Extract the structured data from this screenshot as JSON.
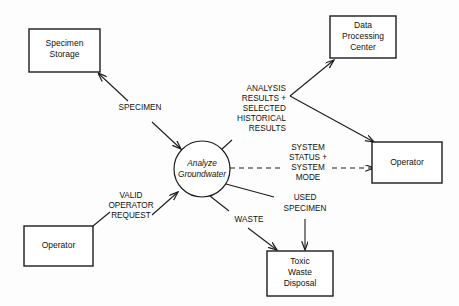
{
  "diagram": {
    "type": "data-flow-diagram",
    "background_color": "#fdfdfd",
    "line_color": "#1c1c1c",
    "process": {
      "name": "analyze-groundwater",
      "label_line1": "Analyze",
      "label_line2": "Groundwater",
      "shape": "circle",
      "cx": 202,
      "cy": 169,
      "r": 28
    },
    "entities": [
      {
        "name": "specimen-storage",
        "label_line1": "Specimen",
        "label_line2": "Storage",
        "label_line3": "",
        "x": 29,
        "y": 29,
        "w": 71,
        "h": 43
      },
      {
        "name": "data-processing-center",
        "label_line1": "Data",
        "label_line2": "Processing",
        "label_line3": "Center",
        "x": 330,
        "y": 16,
        "w": 66,
        "h": 42
      },
      {
        "name": "operator-right",
        "label_line1": "Operator",
        "label_line2": "",
        "label_line3": "",
        "x": 372,
        "y": 142,
        "w": 70,
        "h": 41
      },
      {
        "name": "operator-bottom-left",
        "label_line1": "Operator",
        "label_line2": "",
        "label_line3": "",
        "x": 24,
        "y": 226,
        "w": 69,
        "h": 40
      },
      {
        "name": "toxic-waste-disposal",
        "label_line1": "Toxic",
        "label_line2": "Waste",
        "label_line3": "Disposal",
        "x": 267,
        "y": 251,
        "w": 66,
        "h": 45
      }
    ],
    "flows": [
      {
        "name": "specimen-flow",
        "label_lines": [
          "SPECIMEN"
        ],
        "from": "specimen-storage",
        "to": "analyze-groundwater",
        "style": "solid",
        "arrowheads": "both"
      },
      {
        "name": "analysis-results-flow",
        "label_lines": [
          "ANALYSIS",
          "RESULTS +",
          "SELECTED",
          "HISTORICAL",
          "RESULTS"
        ],
        "from": "analyze-groundwater",
        "to": "data-processing-center, operator-right",
        "style": "solid",
        "arrowheads": "target"
      },
      {
        "name": "system-status-flow",
        "label_lines": [
          "SYSTEM",
          "STATUS +",
          "SYSTEM",
          "MODE"
        ],
        "from": "analyze-groundwater",
        "to": "operator-right",
        "style": "dashed",
        "arrowheads": "target"
      },
      {
        "name": "used-specimen-flow",
        "label_lines": [
          "USED",
          "SPECIMEN"
        ],
        "from": "analyze-groundwater",
        "to": "toxic-waste-disposal",
        "style": "solid",
        "arrowheads": "target"
      },
      {
        "name": "waste-flow",
        "label_lines": [
          "WASTE"
        ],
        "from": "analyze-groundwater",
        "to": "toxic-waste-disposal",
        "style": "solid",
        "arrowheads": "target"
      },
      {
        "name": "valid-operator-request-flow",
        "label_lines": [
          "VALID",
          "OPERATOR",
          "REQUEST"
        ],
        "from": "operator-bottom-left",
        "to": "analyze-groundwater",
        "style": "solid",
        "arrowheads": "target"
      }
    ]
  }
}
